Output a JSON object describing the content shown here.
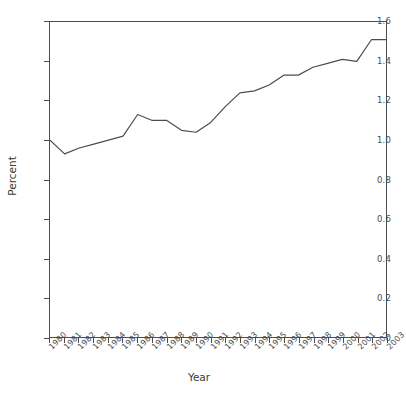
{
  "chart_data": {
    "type": "line",
    "title": "",
    "xlabel": "Year",
    "ylabel": "Percent",
    "grid": false,
    "legend": "none",
    "xlim": [
      1980,
      2003
    ],
    "ylim": [
      0,
      1.6
    ],
    "yticks": [
      "0",
      "0.2",
      "0.4",
      "0.6",
      "0.8",
      "1.0",
      "1.2",
      "1.4",
      "1.6"
    ],
    "ytick_values": [
      0,
      0.2,
      0.4,
      0.6,
      0.8,
      1.0,
      1.2,
      1.4,
      1.6
    ],
    "categories": [
      "1980",
      "1981",
      "1982",
      "1983",
      "1984",
      "1985",
      "1986",
      "1987",
      "1988",
      "1989",
      "1990",
      "1991",
      "1992",
      "1993",
      "1994",
      "1995",
      "1996",
      "1997",
      "1998",
      "1999",
      "2000",
      "2001",
      "2002",
      "2003"
    ],
    "x": [
      1980,
      1981,
      1982,
      1983,
      1984,
      1985,
      1986,
      1987,
      1988,
      1989,
      1990,
      1991,
      1992,
      1993,
      1994,
      1995,
      1996,
      1997,
      1998,
      1999,
      2000,
      2001,
      2002,
      2003
    ],
    "values": [
      1.0,
      0.93,
      0.96,
      0.98,
      1.0,
      1.02,
      1.13,
      1.1,
      1.1,
      1.05,
      1.04,
      1.09,
      1.17,
      1.24,
      1.25,
      1.28,
      1.33,
      1.33,
      1.37,
      1.39,
      1.41,
      1.4,
      1.51,
      1.51
    ],
    "series": [
      {
        "name": "Percent",
        "color": "#4d4d4d",
        "values": [
          1.0,
          0.93,
          0.96,
          0.98,
          1.0,
          1.02,
          1.13,
          1.1,
          1.1,
          1.05,
          1.04,
          1.09,
          1.17,
          1.24,
          1.25,
          1.28,
          1.33,
          1.33,
          1.37,
          1.39,
          1.41,
          1.4,
          1.51,
          1.51
        ]
      }
    ]
  },
  "axes": {
    "y_title": "Percent",
    "x_title": "Year"
  },
  "colors": {
    "line": "#4d4d4d",
    "frame": "#4d4d4d",
    "text": "#3a3a3a",
    "background": "#ffffff"
  }
}
